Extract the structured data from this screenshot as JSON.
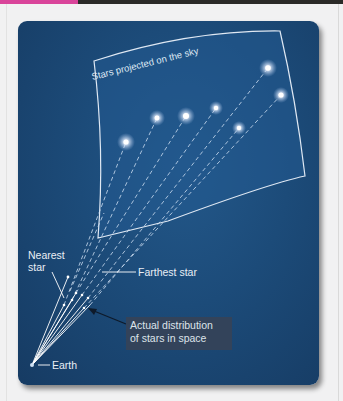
{
  "figure": {
    "sky_label": "Stars projected on the sky",
    "labels": {
      "nearest_star_line1": "Nearest",
      "nearest_star_line2": "star",
      "farthest_star": "Farthest star",
      "earth": "Earth",
      "actual_distribution_line1": "Actual distribution",
      "actual_distribution_line2": "of stars in space"
    },
    "colors": {
      "panel": "#1c4b79",
      "accent_bar": "#d9449a",
      "line": "#ffffff",
      "callout_bg": "#33435a"
    },
    "stars_on_sky": [
      {
        "x": 126,
        "y": 142
      },
      {
        "x": 157,
        "y": 118
      },
      {
        "x": 186,
        "y": 116
      },
      {
        "x": 216,
        "y": 108
      },
      {
        "x": 239,
        "y": 128
      },
      {
        "x": 268,
        "y": 68
      },
      {
        "x": 281,
        "y": 95
      }
    ]
  }
}
